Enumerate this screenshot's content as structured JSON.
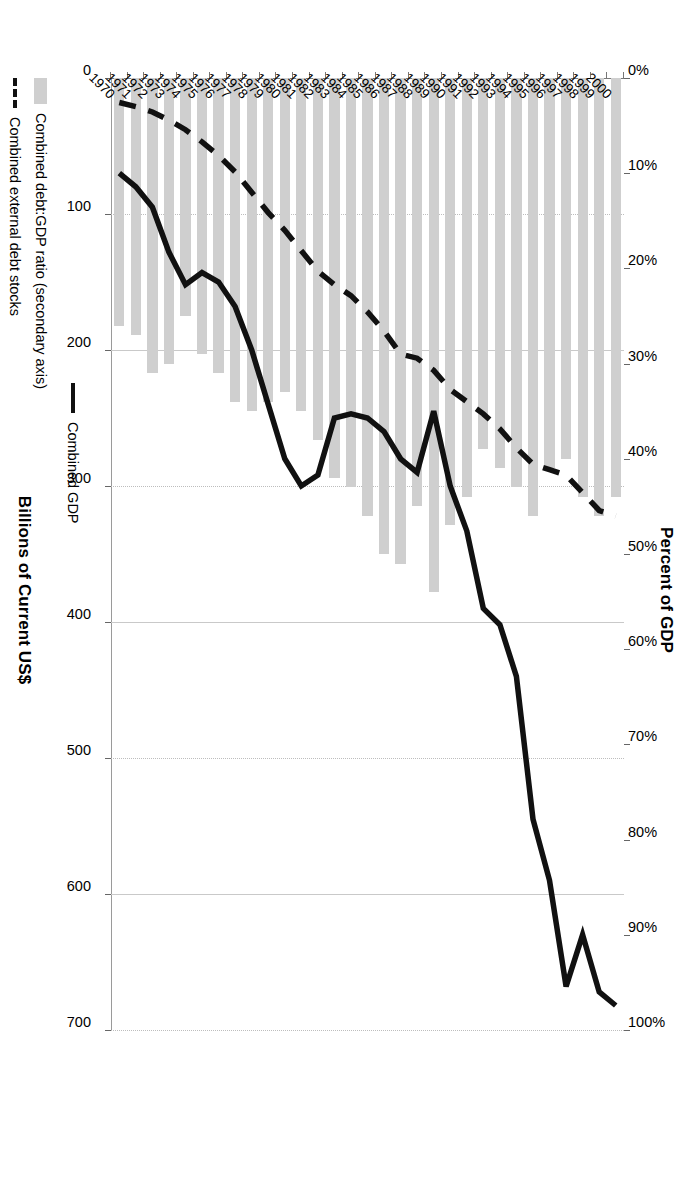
{
  "chart_data": {
    "type": "bar",
    "orientation": "horizontal-rotated",
    "title": "",
    "xlabel": "Billions of Current US$",
    "xlabel_secondary": "Percent of GDP",
    "ylabel": "",
    "grid": true,
    "legend_position": "bottom",
    "xlim": [
      0,
      700
    ],
    "xlim_secondary": [
      0,
      1.0
    ],
    "xticks": [
      "0",
      "100",
      "200",
      "300",
      "400",
      "500",
      "600",
      "700"
    ],
    "xticks_secondary": [
      "0%",
      "10%",
      "20%",
      "30%",
      "40%",
      "50%",
      "60%",
      "70%",
      "80%",
      "90%",
      "100%"
    ],
    "categories": [
      "1970",
      "1971",
      "1972",
      "1973",
      "1974",
      "1975",
      "1976",
      "1977",
      "1978",
      "1979",
      "1980",
      "1981",
      "1982",
      "1983",
      "1984",
      "1985",
      "1986",
      "1987",
      "1988",
      "1989",
      "1990",
      "1991",
      "1992",
      "1993",
      "1994",
      "1995",
      "1996",
      "1997",
      "1998",
      "1999",
      "2000"
    ],
    "series": [
      {
        "name": "Combined debt:GDP ratio (secondary axis)",
        "type": "bar",
        "axis": "secondary",
        "unit": "percent",
        "color": "#cfcfcf",
        "values": [
          0.26,
          0.27,
          0.31,
          0.3,
          0.25,
          0.29,
          0.31,
          0.34,
          0.35,
          0.34,
          0.33,
          0.35,
          0.38,
          0.42,
          0.43,
          0.46,
          0.5,
          0.51,
          0.45,
          0.54,
          0.47,
          0.44,
          0.39,
          0.41,
          0.43,
          0.46,
          0.41,
          0.4,
          0.44,
          0.46,
          0.44
        ]
      },
      {
        "name": "Combined external debt stocks",
        "type": "line",
        "style": "dashed",
        "axis": "primary",
        "unit": "billions US$",
        "color": "#111111",
        "values": [
          18,
          21,
          25,
          31,
          38,
          47,
          57,
          69,
          84,
          99,
          112,
          127,
          142,
          152,
          160,
          172,
          186,
          203,
          206,
          215,
          229,
          238,
          247,
          258,
          272,
          284,
          288,
          292,
          305,
          318,
          322
        ]
      },
      {
        "name": "Combined GDP",
        "type": "line",
        "style": "solid",
        "axis": "primary",
        "unit": "billions US$",
        "color": "#111111",
        "values": [
          70,
          80,
          95,
          128,
          152,
          143,
          150,
          168,
          200,
          240,
          280,
          300,
          292,
          250,
          247,
          250,
          260,
          280,
          290,
          245,
          300,
          333,
          390,
          402,
          440,
          545,
          590,
          668,
          630,
          672,
          682
        ]
      }
    ]
  },
  "legend": {
    "items": [
      {
        "label": "Combined GDP",
        "swatch": "solid-line"
      },
      {
        "label": "Combined debt:GDP ratio (secondary axis)",
        "swatch": "gray-bar"
      },
      {
        "label": "Combined external debt stocks",
        "swatch": "dashed-line"
      }
    ]
  }
}
